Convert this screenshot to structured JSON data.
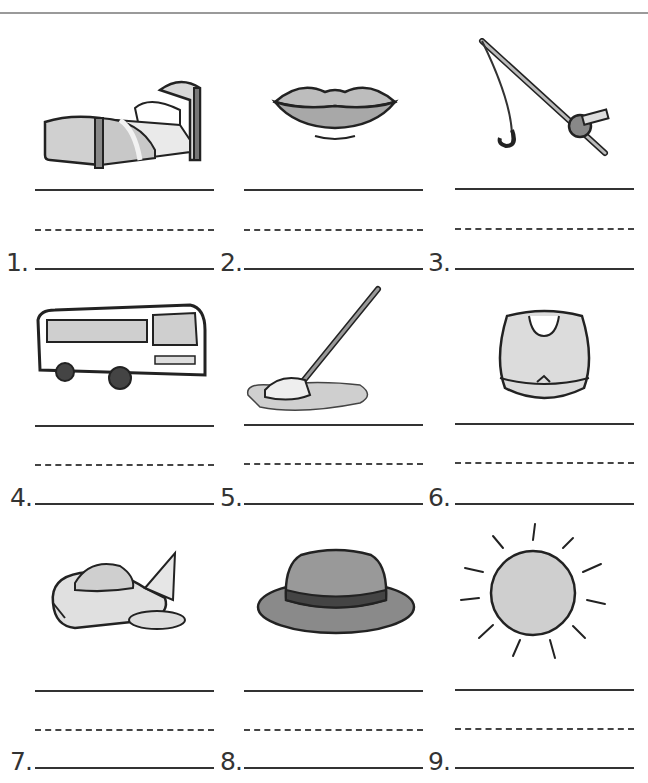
{
  "worksheet": {
    "items": [
      {
        "number": "1.",
        "picture": "bed"
      },
      {
        "number": "2.",
        "picture": "lips"
      },
      {
        "number": "3.",
        "picture": "fishing-rod"
      },
      {
        "number": "4.",
        "picture": "bus"
      },
      {
        "number": "5.",
        "picture": "mop"
      },
      {
        "number": "6.",
        "picture": "bib"
      },
      {
        "number": "7.",
        "picture": "spaceship"
      },
      {
        "number": "8.",
        "picture": "hat"
      },
      {
        "number": "9.",
        "picture": "sun"
      }
    ]
  }
}
